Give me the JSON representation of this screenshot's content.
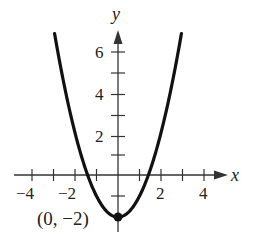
{
  "chart_data": {
    "type": "line",
    "title": "",
    "xlabel": "x",
    "ylabel": "y",
    "function": "y = x^2 - 2",
    "xlim": [
      -4.5,
      5
    ],
    "ylim": [
      -2.5,
      7
    ],
    "x_ticks": [
      -4,
      -3,
      -2,
      -1,
      1,
      2,
      3,
      4
    ],
    "x_tick_labels": [
      "-4",
      "-2",
      "2",
      "4"
    ],
    "y_ticks": [
      1,
      2,
      3,
      4,
      5,
      6
    ],
    "y_tick_labels": [
      "2",
      "4",
      "6"
    ],
    "grid": false,
    "series": [
      {
        "name": "parabola",
        "x": [
          -2.95,
          -2.5,
          -2,
          -1.5,
          -1,
          -0.5,
          0,
          0.5,
          1,
          1.5,
          2,
          2.5,
          2.95
        ],
        "y": [
          6.7,
          4.25,
          2,
          0.25,
          -1,
          -1.75,
          -2,
          -1.75,
          -1,
          0.25,
          2,
          4.25,
          6.7
        ]
      }
    ],
    "annotations": [
      {
        "text": "(0, −2)",
        "point": [
          0,
          -2
        ],
        "marker": "filled-circle"
      }
    ]
  },
  "labels": {
    "x_axis": "x",
    "y_axis": "y",
    "xt_m4": "−4",
    "xt_m2": "−2",
    "xt_2": "2",
    "xt_4": "4",
    "yt_2": "2",
    "yt_4": "4",
    "yt_6": "6",
    "vertex": "(0, −2)"
  }
}
